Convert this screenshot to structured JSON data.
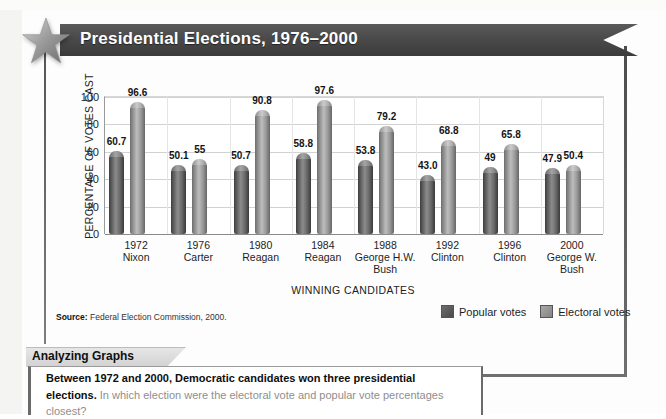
{
  "banner": {
    "title": "Presidential Elections, 1976–2000",
    "star_icon": "star-icon"
  },
  "source": {
    "label": "Source:",
    "text": "Federal Election Commission, 2000."
  },
  "legend": {
    "items": [
      {
        "label": "Popular votes",
        "color": "#5a5a5a"
      },
      {
        "label": "Electoral votes",
        "color": "#9a9a9a"
      }
    ]
  },
  "analyzing": {
    "tab_label": "Analyzing Graphs",
    "bold_text": "Between 1972 and 2000, Democratic candidates won three presidential elections.",
    "question_text": "In which election were the electoral vote and popular vote percentages closest?"
  },
  "chart_data": {
    "type": "bar",
    "title": "Presidential Elections, 1976–2000",
    "xlabel": "WINNING CANDIDATES",
    "ylabel": "PERCENTAGE OF VOTES CAST",
    "ylim": [
      0,
      100
    ],
    "yticks": [
      0,
      20,
      40,
      60,
      80,
      100
    ],
    "ytick_labels": [
      "0",
      "20",
      "40",
      "60",
      "80",
      "100"
    ],
    "grid": true,
    "legend_position": "bottom-right",
    "categories": [
      "1972 Nixon",
      "1976 Carter",
      "1980 Reagan",
      "1984 Reagan",
      "1988 George H.W. Bush",
      "1992 Clinton",
      "1996 Clinton",
      "2000 George W. Bush"
    ],
    "category_years": [
      "1972",
      "1976",
      "1980",
      "1984",
      "1988",
      "1992",
      "1996",
      "2000"
    ],
    "category_names": [
      "Nixon",
      "Carter",
      "Reagan",
      "Reagan",
      "George H.W. Bush",
      "Clinton",
      "Clinton",
      "George W. Bush"
    ],
    "series": [
      {
        "name": "Popular votes",
        "color": "#5a5a5a",
        "values": [
          60.7,
          50.1,
          50.7,
          58.8,
          53.8,
          43.0,
          49,
          47.9
        ],
        "labels": [
          "60.7",
          "50.1",
          "50.7",
          "58.8",
          "53.8",
          "43.0",
          "49",
          "47.9"
        ]
      },
      {
        "name": "Electoral votes",
        "color": "#9a9a9a",
        "values": [
          96.6,
          55,
          90.8,
          97.6,
          79.2,
          68.8,
          65.8,
          50.4
        ],
        "labels": [
          "96.6",
          "55",
          "90.8",
          "97.6",
          "79.2",
          "68.8",
          "65.8",
          "50.4"
        ]
      }
    ]
  }
}
